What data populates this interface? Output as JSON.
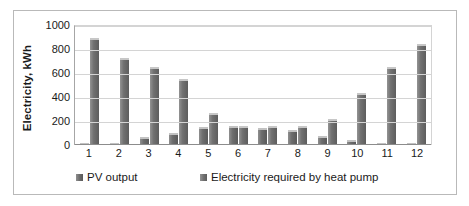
{
  "chart_data": {
    "type": "bar",
    "title": "",
    "xlabel": "",
    "ylabel": "Electricity, kWh",
    "ylim": [
      0,
      1000
    ],
    "yticks": [
      0,
      200,
      400,
      600,
      800,
      1000
    ],
    "grid": true,
    "legend_position": "bottom",
    "categories": [
      "1",
      "2",
      "3",
      "4",
      "5",
      "6",
      "7",
      "8",
      "9",
      "10",
      "11",
      "12"
    ],
    "series": [
      {
        "name": "PV output",
        "color": "#6d6d6d",
        "values": [
          10,
          20,
          65,
          100,
          150,
          155,
          145,
          125,
          75,
          40,
          15,
          10
        ]
      },
      {
        "name": "Electricity required by heat pump",
        "color": "#717171",
        "values": [
          890,
          725,
          650,
          550,
          265,
          155,
          155,
          155,
          215,
          435,
          650,
          845
        ]
      }
    ]
  }
}
